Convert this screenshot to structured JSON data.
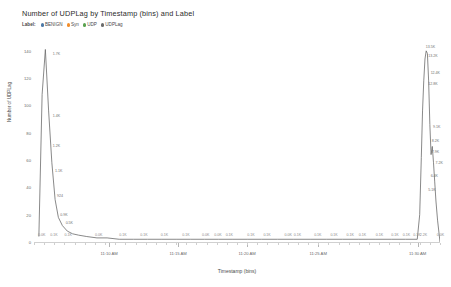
{
  "header": {
    "title": "Number of UDPLag by Timestamp (bins) and Label"
  },
  "legend": {
    "title": "Label:",
    "items": [
      {
        "label": "BENIGN",
        "color": "#4e79a7"
      },
      {
        "label": "Syn",
        "color": "#f28e2b"
      },
      {
        "label": "UDP",
        "color": "#59a14f"
      },
      {
        "label": "UDPLag",
        "color": "#6b6b6b"
      }
    ]
  },
  "chart_data": {
    "type": "line",
    "title": "Number of UDPLag by Timestamp (bins) and Label",
    "xlabel": "Timestamp (bins)",
    "ylabel": "Number of UDPLag",
    "ylim": [
      0,
      145
    ],
    "yticks": [
      0,
      20,
      40,
      60,
      80,
      100,
      120,
      140
    ],
    "ytick_labels": [
      "0",
      "20",
      "40",
      "60",
      "80",
      "100",
      "120",
      "140"
    ],
    "grid": false,
    "legend_position": "top-left",
    "xlim": [
      "11:07 AM",
      "11:32 AM"
    ],
    "xtick_labels": [
      "11:10 AM",
      "11:15 AM",
      "11:20 AM",
      "11:25 AM",
      "11:30 AM"
    ],
    "xtick_positions": [
      0.185,
      0.355,
      0.525,
      0.7,
      0.945
    ],
    "series": [
      {
        "name": "UDPLag",
        "color": "#6b6b6b",
        "x": [
          0.012,
          0.02,
          0.028,
          0.036,
          0.044,
          0.052,
          0.06,
          0.07,
          0.082,
          0.095,
          0.11,
          0.13,
          0.155,
          0.18,
          0.21,
          0.245,
          0.28,
          0.315,
          0.35,
          0.385,
          0.42,
          0.455,
          0.49,
          0.525,
          0.56,
          0.6,
          0.64,
          0.68,
          0.72,
          0.76,
          0.8,
          0.84,
          0.88,
          0.915,
          0.944,
          0.95,
          0.954,
          0.957,
          0.96,
          0.963,
          0.966,
          0.969,
          0.972,
          0.975,
          0.978,
          0.981,
          0.984,
          0.987,
          0.99,
          0.994,
          1.0
        ],
        "y": [
          4,
          108,
          141,
          96,
          58,
          31,
          18,
          12,
          8,
          6,
          5,
          4,
          3,
          3,
          2,
          2,
          2,
          2,
          2,
          2,
          2,
          2,
          2,
          2,
          2,
          2,
          2,
          2,
          2,
          2,
          2,
          2,
          2,
          2,
          2,
          20,
          62,
          96,
          118,
          134,
          140,
          138,
          118,
          86,
          64,
          70,
          58,
          44,
          30,
          16,
          0
        ]
      }
    ],
    "point_labels_left": [
      {
        "text": "1.7K",
        "x": 0.041,
        "y": 138
      },
      {
        "text": "1.4K",
        "x": 0.041,
        "y": 92
      },
      {
        "text": "1.2K",
        "x": 0.041,
        "y": 70
      },
      {
        "text": "1.1K",
        "x": 0.047,
        "y": 52
      },
      {
        "text": "924",
        "x": 0.052,
        "y": 34
      },
      {
        "text": "0.9K",
        "x": 0.06,
        "y": 20
      },
      {
        "text": "0.5K",
        "x": 0.073,
        "y": 14
      }
    ],
    "point_labels_right": [
      {
        "text": "13.5K",
        "x": 0.96,
        "y": 143
      },
      {
        "text": "13.2K",
        "x": 0.966,
        "y": 136
      },
      {
        "text": "12.4K",
        "x": 0.972,
        "y": 124
      },
      {
        "text": "12.8K",
        "x": 0.966,
        "y": 116
      },
      {
        "text": "9.1K",
        "x": 0.978,
        "y": 84
      },
      {
        "text": "8.2K",
        "x": 0.975,
        "y": 74
      },
      {
        "text": "7.9K",
        "x": 0.975,
        "y": 66
      },
      {
        "text": "7.2K",
        "x": 0.984,
        "y": 58
      },
      {
        "text": "6.4K",
        "x": 0.972,
        "y": 48
      },
      {
        "text": "5.1K",
        "x": 0.966,
        "y": 38
      }
    ],
    "axis_value_labels": [
      {
        "text": "0.0K",
        "x": 0.01
      },
      {
        "text": "0.1K",
        "x": 0.04
      },
      {
        "text": "0.1K",
        "x": 0.075
      },
      {
        "text": "0.0K",
        "x": 0.15
      },
      {
        "text": "0.1K",
        "x": 0.21
      },
      {
        "text": "0.1K",
        "x": 0.262
      },
      {
        "text": "0.1K",
        "x": 0.312
      },
      {
        "text": "0.1K",
        "x": 0.365
      },
      {
        "text": "0.0K",
        "x": 0.414
      },
      {
        "text": "0.0K",
        "x": 0.444
      },
      {
        "text": "0.1K",
        "x": 0.472
      },
      {
        "text": "0.1K",
        "x": 0.525
      },
      {
        "text": "0.1K",
        "x": 0.565
      },
      {
        "text": "0.0K",
        "x": 0.617
      },
      {
        "text": "0.1K",
        "x": 0.64
      },
      {
        "text": "0.1K",
        "x": 0.69
      },
      {
        "text": "0.1K",
        "x": 0.73
      },
      {
        "text": "0.1K",
        "x": 0.77
      },
      {
        "text": "0.1K",
        "x": 0.8
      },
      {
        "text": "0.1K",
        "x": 0.842
      },
      {
        "text": "0.1K",
        "x": 0.88
      },
      {
        "text": "0.1K",
        "x": 0.908
      },
      {
        "text": "0.1K",
        "x": 0.934
      },
      {
        "text": "2.2K",
        "x": 0.95
      },
      {
        "text": "0.0K",
        "x": 0.992
      }
    ]
  }
}
